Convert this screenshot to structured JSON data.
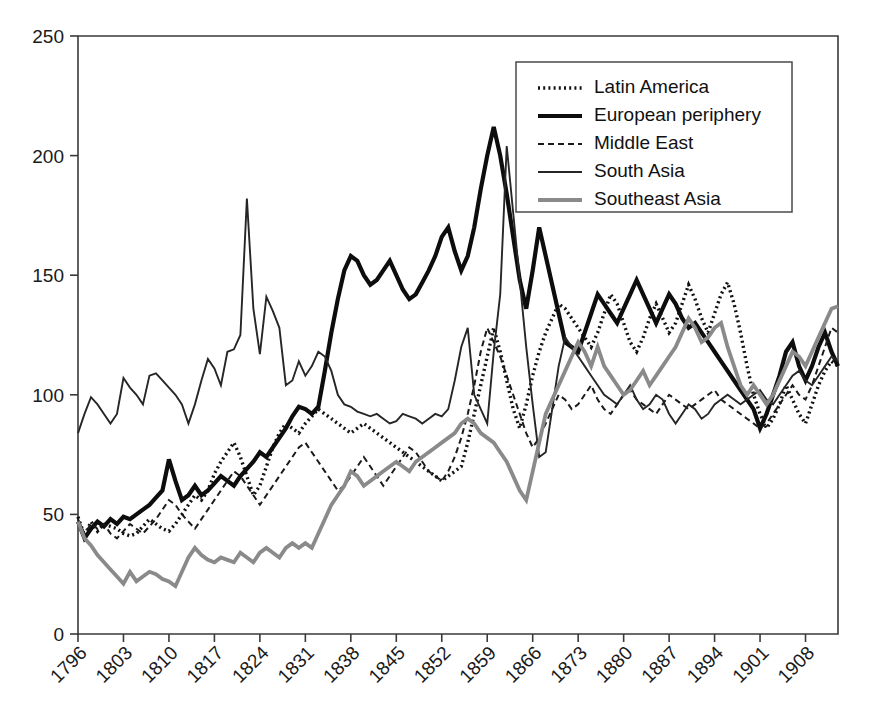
{
  "chart_data": {
    "type": "line",
    "title": "",
    "subtitle": "",
    "xlabel": "",
    "ylabel": "",
    "xlim": [
      1796,
      1913
    ],
    "ylim": [
      0,
      250
    ],
    "ytick_values": [
      0,
      50,
      100,
      150,
      200,
      250
    ],
    "ytick_labels": [
      "0",
      "50",
      "100",
      "150",
      "200",
      "250"
    ],
    "xtick_values": [
      1796,
      1803,
      1810,
      1817,
      1824,
      1831,
      1838,
      1845,
      1852,
      1859,
      1866,
      1873,
      1880,
      1887,
      1894,
      1901,
      1908
    ],
    "xtick_labels": [
      "1796",
      "1803",
      "1810",
      "1817",
      "1824",
      "1831",
      "1838",
      "1845",
      "1852",
      "1859",
      "1866",
      "1873",
      "1880",
      "1887",
      "1894",
      "1901",
      "1908"
    ],
    "grid": false,
    "legend_position": "top-right",
    "x": [
      1796,
      1797,
      1798,
      1799,
      1800,
      1801,
      1802,
      1803,
      1804,
      1805,
      1806,
      1807,
      1808,
      1809,
      1810,
      1811,
      1812,
      1813,
      1814,
      1815,
      1816,
      1817,
      1818,
      1819,
      1820,
      1821,
      1822,
      1823,
      1824,
      1825,
      1826,
      1827,
      1828,
      1829,
      1830,
      1831,
      1832,
      1833,
      1834,
      1835,
      1836,
      1837,
      1838,
      1839,
      1840,
      1841,
      1842,
      1843,
      1844,
      1845,
      1846,
      1847,
      1848,
      1849,
      1850,
      1851,
      1852,
      1853,
      1854,
      1855,
      1856,
      1857,
      1858,
      1859,
      1860,
      1861,
      1862,
      1863,
      1864,
      1865,
      1866,
      1867,
      1868,
      1869,
      1870,
      1871,
      1872,
      1873,
      1874,
      1875,
      1876,
      1877,
      1878,
      1879,
      1880,
      1881,
      1882,
      1883,
      1884,
      1885,
      1886,
      1887,
      1888,
      1889,
      1890,
      1891,
      1892,
      1893,
      1894,
      1895,
      1896,
      1897,
      1898,
      1899,
      1900,
      1901,
      1902,
      1903,
      1904,
      1905,
      1906,
      1907,
      1908,
      1909,
      1910,
      1911,
      1912,
      1913
    ],
    "series": [
      {
        "name": "Latin America",
        "style": "dotted",
        "color": "#111111",
        "width": 3.4,
        "dash": "2,3.2",
        "values": [
          49,
          41,
          47,
          43,
          46,
          45,
          44,
          42,
          41,
          42,
          45,
          48,
          46,
          44,
          43,
          46,
          50,
          54,
          58,
          56,
          60,
          67,
          72,
          76,
          80,
          74,
          66,
          58,
          62,
          70,
          78,
          84,
          88,
          86,
          84,
          88,
          91,
          94,
          92,
          90,
          88,
          86,
          84,
          86,
          88,
          86,
          84,
          82,
          80,
          78,
          76,
          74,
          72,
          70,
          68,
          66,
          64,
          66,
          68,
          70,
          80,
          92,
          104,
          116,
          128,
          118,
          106,
          94,
          86,
          96,
          108,
          118,
          126,
          132,
          138,
          136,
          132,
          128,
          124,
          120,
          126,
          134,
          142,
          138,
          130,
          122,
          118,
          124,
          132,
          138,
          132,
          126,
          130,
          138,
          146,
          140,
          132,
          126,
          134,
          142,
          147,
          138,
          126,
          112,
          100,
          92,
          86,
          90,
          96,
          104,
          98,
          92,
          88,
          96,
          104,
          110,
          114,
          112
        ]
      },
      {
        "name": "European periphery",
        "style": "solid",
        "color": "#0d0d0d",
        "width": 4.2,
        "dash": "none",
        "values": [
          47,
          40,
          44,
          47,
          45,
          48,
          46,
          49,
          48,
          50,
          52,
          54,
          57,
          60,
          73,
          64,
          56,
          58,
          62,
          58,
          60,
          63,
          66,
          64,
          62,
          66,
          69,
          72,
          76,
          74,
          78,
          82,
          86,
          91,
          95,
          94,
          92,
          95,
          110,
          126,
          140,
          152,
          158,
          156,
          150,
          146,
          148,
          152,
          156,
          150,
          144,
          140,
          142,
          147,
          152,
          158,
          166,
          170,
          160,
          152,
          158,
          170,
          186,
          200,
          212,
          200,
          184,
          166,
          148,
          136,
          152,
          170,
          158,
          146,
          134,
          122,
          120,
          118,
          126,
          134,
          142,
          138,
          134,
          130,
          136,
          142,
          148,
          142,
          136,
          130,
          136,
          142,
          138,
          132,
          128,
          130,
          126,
          122,
          118,
          114,
          110,
          106,
          102,
          98,
          94,
          86,
          92,
          100,
          108,
          118,
          122,
          112,
          106,
          112,
          120,
          126,
          118,
          112
        ]
      },
      {
        "name": "Middle East",
        "style": "dashed",
        "color": "#1a1a1a",
        "width": 2.0,
        "dash": "6,4",
        "values": [
          48,
          42,
          46,
          44,
          46,
          42,
          40,
          43,
          46,
          44,
          42,
          45,
          48,
          52,
          56,
          54,
          50,
          47,
          44,
          48,
          52,
          56,
          60,
          64,
          68,
          66,
          62,
          58,
          54,
          58,
          62,
          66,
          70,
          74,
          78,
          80,
          76,
          72,
          68,
          64,
          60,
          62,
          66,
          70,
          74,
          70,
          66,
          62,
          66,
          70,
          74,
          78,
          76,
          72,
          68,
          66,
          64,
          68,
          74,
          82,
          92,
          104,
          118,
          128,
          122,
          116,
          108,
          100,
          92,
          84,
          78,
          82,
          88,
          94,
          100,
          98,
          94,
          96,
          100,
          104,
          98,
          94,
          92,
          96,
          100,
          102,
          98,
          96,
          94,
          92,
          96,
          100,
          98,
          96,
          94,
          96,
          98,
          100,
          102,
          98,
          96,
          94,
          92,
          90,
          88,
          86,
          88,
          92,
          96,
          100,
          104,
          100,
          98,
          104,
          112,
          120,
          128,
          126
        ]
      },
      {
        "name": "South Asia",
        "style": "solid",
        "color": "#262626",
        "width": 1.9,
        "dash": "none",
        "values": [
          84,
          92,
          99,
          96,
          92,
          88,
          92,
          107,
          103,
          100,
          96,
          108,
          109,
          106,
          103,
          100,
          96,
          88,
          96,
          106,
          115,
          111,
          104,
          118,
          119,
          125,
          182,
          136,
          117,
          141,
          135,
          128,
          104,
          106,
          114,
          108,
          112,
          118,
          116,
          110,
          100,
          96,
          95,
          93,
          92,
          91,
          92,
          90,
          88,
          89,
          92,
          91,
          90,
          88,
          90,
          92,
          91,
          94,
          106,
          120,
          128,
          100,
          94,
          88,
          118,
          142,
          204,
          176,
          148,
          120,
          96,
          74,
          76,
          94,
          112,
          124,
          120,
          116,
          112,
          108,
          104,
          100,
          98,
          96,
          100,
          104,
          98,
          94,
          96,
          100,
          98,
          92,
          88,
          92,
          96,
          94,
          90,
          92,
          96,
          98,
          100,
          98,
          96,
          98,
          100,
          102,
          98,
          96,
          100,
          104,
          108,
          110,
          106,
          104,
          108,
          112,
          116,
          114
        ]
      },
      {
        "name": "Southeast Asia",
        "style": "solid",
        "color": "#8a8a8a",
        "width": 3.8,
        "dash": "none",
        "values": [
          47,
          40,
          37,
          33,
          30,
          27,
          24,
          21,
          26,
          22,
          24,
          26,
          25,
          23,
          22,
          20,
          26,
          32,
          36,
          33,
          31,
          30,
          32,
          31,
          30,
          34,
          32,
          30,
          34,
          36,
          34,
          32,
          36,
          38,
          36,
          38,
          36,
          42,
          48,
          54,
          58,
          62,
          68,
          66,
          62,
          64,
          66,
          68,
          70,
          72,
          70,
          68,
          72,
          74,
          76,
          78,
          80,
          82,
          84,
          88,
          90,
          88,
          84,
          82,
          80,
          76,
          72,
          66,
          60,
          56,
          68,
          80,
          92,
          98,
          104,
          110,
          116,
          122,
          118,
          112,
          120,
          112,
          108,
          104,
          100,
          102,
          106,
          110,
          104,
          108,
          112,
          116,
          120,
          126,
          132,
          128,
          122,
          124,
          128,
          130,
          120,
          112,
          104,
          100,
          104,
          100,
          96,
          100,
          106,
          112,
          118,
          116,
          112,
          118,
          124,
          130,
          136,
          137
        ]
      }
    ]
  },
  "legend": {
    "entries": [
      {
        "label": "Latin America",
        "swatch": "dotted-thick-black"
      },
      {
        "label": "European periphery",
        "swatch": "solid-thick-black"
      },
      {
        "label": "Middle East",
        "swatch": "dashed-thin-black"
      },
      {
        "label": "South Asia",
        "swatch": "solid-thin-black"
      },
      {
        "label": "Southeast Asia",
        "swatch": "solid-medium-gray"
      }
    ]
  },
  "colors": {
    "axis": "#3a3a3a",
    "text": "#1a1a1a",
    "background": "#ffffff",
    "latin_america": "#111111",
    "european_periphery": "#0d0d0d",
    "middle_east": "#1a1a1a",
    "south_asia": "#262626",
    "southeast_asia": "#8a8a8a"
  }
}
